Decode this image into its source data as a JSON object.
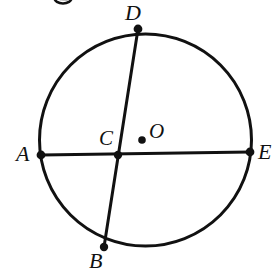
{
  "figure": {
    "kind": "circle-geometry-diagram",
    "background_color": "#ffffff",
    "ink_color": "#111111",
    "stroke_width_circle": 3,
    "stroke_width_chord": 3,
    "dot_radius": 4.2,
    "center_dot_radius": 3.6
  },
  "circle": {
    "name": "main-circle",
    "cx": 145.5,
    "cy": 140,
    "r": 106
  },
  "center": {
    "name": "center-point-O",
    "label": "O",
    "cx": 142,
    "cy": 140
  },
  "points": [
    {
      "id": "A",
      "label": "A",
      "cx": 41,
      "cy": 155,
      "on_circle": true,
      "label_position": "left"
    },
    {
      "id": "B",
      "label": "B",
      "cx": 104,
      "cy": 247,
      "on_circle": true,
      "label_position": "below-left"
    },
    {
      "id": "C",
      "label": "C",
      "cx": 118,
      "cy": 155,
      "on_circle": false,
      "label_position": "above-left"
    },
    {
      "id": "D",
      "label": "D",
      "cx": 138,
      "cy": 29,
      "on_circle": true,
      "label_position": "above"
    },
    {
      "id": "E",
      "label": "E",
      "cx": 250,
      "cy": 152,
      "on_circle": true,
      "label_position": "right"
    }
  ],
  "chords": [
    {
      "id": "AE",
      "name": "chord-A-E",
      "from": "A",
      "to": "E",
      "x1": 41,
      "y1": 155,
      "x2": 250,
      "y2": 152
    },
    {
      "id": "BD",
      "name": "chord-B-D",
      "from": "B",
      "to": "D",
      "x1": 104,
      "y1": 247,
      "x2": 138,
      "y2": 29
    }
  ],
  "artifacts": {
    "top_edge_mark": {
      "name": "cropped-glyph-top-edge",
      "cx": 63,
      "cy": 1,
      "rx": 8,
      "ry": 5
    }
  }
}
